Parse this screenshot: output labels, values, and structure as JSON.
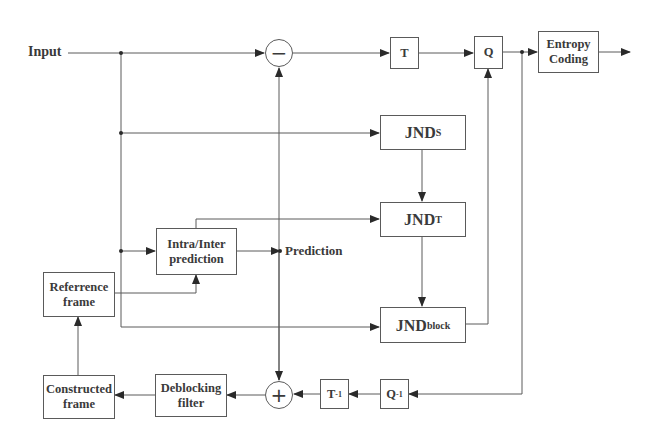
{
  "labels": {
    "input": "Input",
    "prediction": "Prediction"
  },
  "blocks": {
    "transform": "T",
    "quantize": "Q",
    "entropy_line1": "Entropy",
    "entropy_line2": "Coding",
    "jnd_s_main": "JND",
    "jnd_s_sub": "S",
    "jnd_t_main": "JND",
    "jnd_t_sub": "T",
    "jnd_block_main": "JND",
    "jnd_block_sub": "block",
    "intra_line1": "Intra/Inter",
    "intra_line2": "prediction",
    "ref_line1": "Referrence",
    "ref_line2": "frame",
    "constructed_line1": "Constructed",
    "constructed_line2": "frame",
    "deblock_line1": "Deblocking",
    "deblock_line2": "filter",
    "inv_transform_main": "T",
    "inv_transform_sup": "-1",
    "inv_quantize_main": "Q",
    "inv_quantize_sup": "-1"
  },
  "operators": {
    "subtract": "−",
    "add": "+"
  },
  "colors": {
    "line": "#5a5a5a",
    "text": "#3a3a3a",
    "background": "#ffffff"
  }
}
